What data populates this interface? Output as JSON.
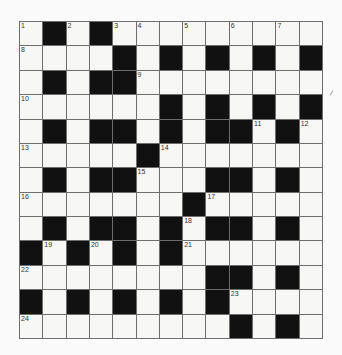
{
  "puzzle": {
    "type": "crossword",
    "rows": 13,
    "cols": 13,
    "colors": {
      "black_square": "#111111",
      "white_square": "#f7f7f5",
      "grid_line": "#6e6e6e",
      "background": "#fafafa"
    },
    "layout": [
      "W B W B W W W W W W W W W",
      "W W W W B W B W B W B W B",
      "W B W B B W W W W W W W W",
      "W W W W W W B W B W B W B",
      "W B W B B W B W B B W B W",
      "W W W W W B W W W W W W W",
      "W B W B B W W W B B W B W",
      "W W W W W W W B W W W W W",
      "W B W B B W B W B B W B W",
      "B W B W B W B W W W W W W",
      "W W W W W W W W B B W B W",
      "B W B W B W B W B W W W W",
      "W W W W W W W W W B W B W"
    ],
    "numbers": [
      {
        "row": 0,
        "col": 0,
        "n": "1"
      },
      {
        "row": 0,
        "col": 2,
        "n": "2"
      },
      {
        "row": 0,
        "col": 4,
        "n": "3"
      },
      {
        "row": 0,
        "col": 5,
        "n": "4"
      },
      {
        "row": 0,
        "col": 7,
        "n": "5"
      },
      {
        "row": 0,
        "col": 9,
        "n": "6"
      },
      {
        "row": 0,
        "col": 11,
        "n": "7"
      },
      {
        "row": 1,
        "col": 0,
        "n": "8"
      },
      {
        "row": 2,
        "col": 5,
        "n": "9"
      },
      {
        "row": 3,
        "col": 0,
        "n": "10"
      },
      {
        "row": 4,
        "col": 10,
        "n": "11"
      },
      {
        "row": 4,
        "col": 12,
        "n": "12"
      },
      {
        "row": 5,
        "col": 0,
        "n": "13"
      },
      {
        "row": 5,
        "col": 6,
        "n": "14"
      },
      {
        "row": 6,
        "col": 5,
        "n": "15"
      },
      {
        "row": 7,
        "col": 0,
        "n": "16"
      },
      {
        "row": 7,
        "col": 8,
        "n": "17"
      },
      {
        "row": 8,
        "col": 7,
        "n": "18"
      },
      {
        "row": 9,
        "col": 1,
        "n": "19"
      },
      {
        "row": 9,
        "col": 3,
        "n": "20"
      },
      {
        "row": 9,
        "col": 7,
        "n": "21"
      },
      {
        "row": 10,
        "col": 0,
        "n": "22"
      },
      {
        "row": 11,
        "col": 9,
        "n": "23"
      },
      {
        "row": 12,
        "col": 0,
        "n": "24"
      }
    ]
  }
}
